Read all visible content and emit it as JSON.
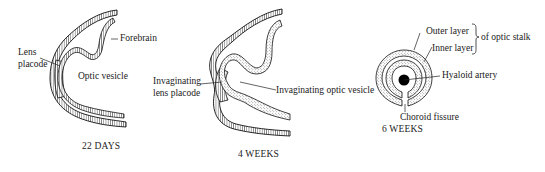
{
  "figure": {
    "panels": [
      {
        "caption": "22 DAYS",
        "labels": {
          "lens_placode_line1": "Lens",
          "lens_placode_line2": "placode",
          "forebrain": "Forebrain",
          "optic_vesicle": "Optic vesicle"
        }
      },
      {
        "caption": "4 WEEKS",
        "labels": {
          "invaginating_lens_line1": "Invaginating",
          "invaginating_lens_line2": "lens placode",
          "invaginating_optic_vesicle": "Invaginating optic vesicle"
        }
      },
      {
        "caption": "6 WEEKS",
        "labels": {
          "outer_layer": "Outer layer",
          "inner_layer": "Inner layer",
          "of_optic_stalk": "of optic stalk",
          "hyaloid_artery": "Hyaloid artery",
          "choroid_fissure": "Choroid fissure"
        }
      }
    ],
    "colors": {
      "ink": "#1a1a1a",
      "background": "#ffffff"
    }
  }
}
